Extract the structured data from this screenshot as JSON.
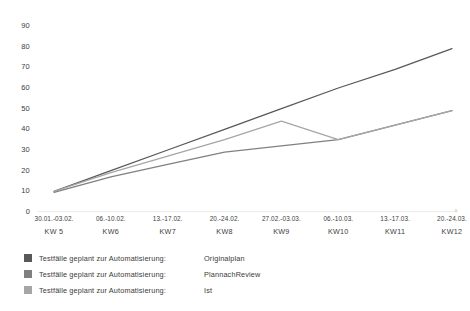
{
  "chart_data": {
    "type": "line",
    "title": "",
    "xlabel": "",
    "ylabel": "",
    "ylim": [
      0,
      90
    ],
    "ytick_step": 10,
    "yticks": [
      90,
      80,
      70,
      60,
      50,
      40,
      30,
      20,
      10,
      0
    ],
    "grid": false,
    "legend_position": "below",
    "categories": [
      "30.01.-03.02.",
      "06.-10.02.",
      "13.-17.02.",
      "20.-24.02.",
      "27.02.-03.03.",
      "06.-10.03.",
      "13.-17.03.",
      "20.-24.03."
    ],
    "category_weeks": [
      "KW 5",
      "KW6",
      "KW7",
      "KW8",
      "KW9",
      "KW10",
      "KW11",
      "KW12"
    ],
    "series": [
      {
        "name": "Originalplan",
        "legend_label": "Testfälle geplant zur Automatisierung:",
        "color": "#595959",
        "values": [
          10,
          20,
          30,
          40,
          50,
          60,
          69,
          79
        ]
      },
      {
        "name": "PlannachReview",
        "legend_label": "Testfälle geplant zur Automatisierung:",
        "color": "#808080",
        "values": [
          9.5,
          17,
          23,
          29,
          32,
          35,
          42,
          49
        ]
      },
      {
        "name": "Ist",
        "legend_label": "Testfälle geplant zur Automatisierung:",
        "color": "#a6a6a6",
        "values": [
          10,
          19,
          27,
          35,
          44,
          35,
          42,
          49
        ]
      }
    ]
  },
  "axis": {
    "line_color": "#d9d9d9",
    "tick_color": "#3d3d3d"
  },
  "legend": {
    "rows": [
      {
        "label": "Testfälle geplant zur Automatisierung:",
        "series": "Originalplan",
        "color": "#595959"
      },
      {
        "label": "Testfälle geplant zur Automatisierung:",
        "series": "PlannachReview",
        "color": "#808080"
      },
      {
        "label": "Testfälle geplant zur Automatisierung:",
        "series": "Ist",
        "color": "#a6a6a6"
      }
    ]
  }
}
